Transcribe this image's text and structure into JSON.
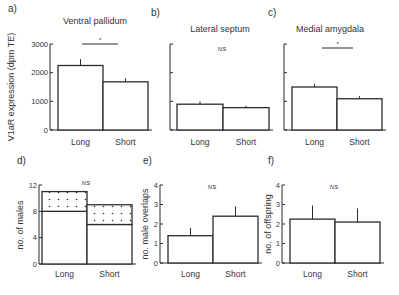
{
  "chart_data": [
    {
      "type": "bar",
      "panel": "a)",
      "title": "Ventral pallidum",
      "ylabel": "V1aR expression (dpm TE)",
      "xlabel": "",
      "categories": [
        "Long",
        "Short"
      ],
      "values": [
        2250,
        1680
      ],
      "errors": [
        220,
        120
      ],
      "ylim": [
        0,
        3000
      ],
      "yticks": [
        0,
        1000,
        2000,
        3000
      ],
      "ytick_labels": [
        "0",
        "1000",
        "2000",
        "3000"
      ],
      "significance": "*"
    },
    {
      "type": "bar",
      "panel": "b)",
      "title": "Lateral septum",
      "ylabel": "",
      "xlabel": "",
      "categories": [
        "Long",
        "Short"
      ],
      "values": [
        900,
        780
      ],
      "errors": [
        100,
        70
      ],
      "ylim": [
        0,
        3000
      ],
      "yticks": [
        0,
        1000,
        2000,
        3000
      ],
      "ytick_labels": [
        "",
        "",
        "",
        ""
      ],
      "significance": "NS"
    },
    {
      "type": "bar",
      "panel": "c)",
      "title": "Medial amygdala",
      "ylabel": "",
      "xlabel": "",
      "categories": [
        "Long",
        "Short"
      ],
      "values": [
        1500,
        1090
      ],
      "errors": [
        110,
        90
      ],
      "ylim": [
        0,
        3000
      ],
      "yticks": [
        0,
        1000,
        2000,
        3000
      ],
      "ytick_labels": [
        "",
        "",
        "",
        ""
      ],
      "significance": "*"
    },
    {
      "type": "bar",
      "stacked": true,
      "panel": "d)",
      "title": "",
      "ylabel": "no. of males",
      "xlabel": "",
      "categories": [
        "Long",
        "Short"
      ],
      "series": [
        {
          "name": "lower (plain)",
          "values": [
            8,
            6
          ]
        },
        {
          "name": "upper (dotted)",
          "values": [
            3,
            3
          ]
        }
      ],
      "ylim": [
        0,
        12
      ],
      "yticks": [
        0,
        4,
        8,
        12
      ],
      "ytick_labels": [
        "0",
        "4",
        "8",
        "12"
      ],
      "significance": "NS"
    },
    {
      "type": "bar",
      "panel": "e)",
      "title": "",
      "ylabel": "no. male overlaps",
      "xlabel": "",
      "categories": [
        "Long",
        "Short"
      ],
      "values": [
        1.4,
        2.4
      ],
      "errors": [
        0.4,
        0.5
      ],
      "ylim": [
        0,
        4
      ],
      "yticks": [
        0,
        1,
        2,
        3,
        4
      ],
      "ytick_labels": [
        "0",
        "1",
        "2",
        "3",
        "4"
      ],
      "significance": "NS"
    },
    {
      "type": "bar",
      "panel": "f)",
      "title": "",
      "ylabel": "no. of offspring",
      "xlabel": "",
      "categories": [
        "Long",
        "Short"
      ],
      "values": [
        2.25,
        2.1
      ],
      "errors": [
        0.7,
        0.7
      ],
      "ylim": [
        0,
        4
      ],
      "yticks": [
        0,
        1,
        2,
        3,
        4
      ],
      "ytick_labels": [
        "0",
        "1",
        "2",
        "3",
        "4"
      ],
      "significance": "NS"
    }
  ]
}
